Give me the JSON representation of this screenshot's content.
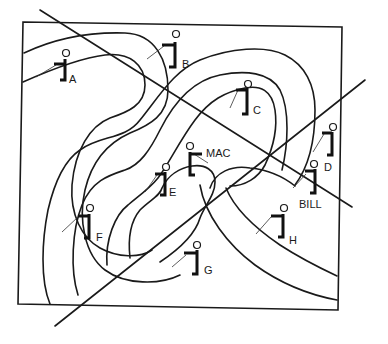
{
  "figure": {
    "type": "topographic contour diagram with observers and sight lines",
    "frame_color": "#1a1a1a",
    "background": "#ffffff"
  },
  "observers": [
    {
      "id": "A",
      "label": "A",
      "x": 62,
      "y": 62,
      "label_x": 69,
      "label_y": 78
    },
    {
      "id": "B",
      "label": "B",
      "x": 172,
      "y": 45,
      "label_x": 182,
      "label_y": 61
    },
    {
      "id": "C",
      "label": "C",
      "x": 245,
      "y": 90,
      "label_x": 253,
      "label_y": 107
    },
    {
      "id": "MAC",
      "label": "MAC",
      "x": 190,
      "y": 158,
      "label_x": 205,
      "label_y": 148
    },
    {
      "id": "D",
      "label": "D",
      "x": 330,
      "y": 138,
      "label_x": 324,
      "label_y": 163
    },
    {
      "id": "E",
      "label": "E",
      "x": 163,
      "y": 178,
      "label_x": 169,
      "label_y": 189
    },
    {
      "id": "BILL",
      "label": "BILL",
      "x": 313,
      "y": 173,
      "label_x": 299,
      "label_y": 201
    },
    {
      "id": "F",
      "label": "F",
      "x": 89,
      "y": 212,
      "label_x": 96,
      "label_y": 234
    },
    {
      "id": "H",
      "label": "H",
      "x": 284,
      "y": 217,
      "label_x": 289,
      "label_y": 237
    },
    {
      "id": "G",
      "label": "G",
      "x": 196,
      "y": 250,
      "label_x": 204,
      "label_y": 267
    }
  ],
  "sight_lines": [
    {
      "name": "line-1",
      "from": [
        40,
        10
      ],
      "to": [
        352,
        207
      ]
    },
    {
      "name": "line-2",
      "from": [
        55,
        326
      ],
      "to": [
        365,
        80
      ]
    }
  ]
}
